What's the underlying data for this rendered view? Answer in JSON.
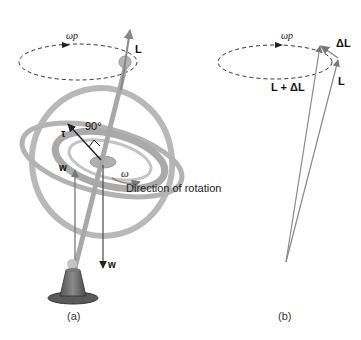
{
  "panel_a": {
    "caption": "(a)",
    "labels": {
      "omega_p": "ωp",
      "L": "L",
      "tau": "τ",
      "angle": "90°",
      "w_upper": "w",
      "w_lower": "w",
      "omega": "ω",
      "direction": "Direction of rotation"
    }
  },
  "panel_b": {
    "caption": "(b)",
    "labels": {
      "omega_p": "ωp",
      "delta_L": "ΔL",
      "L": "L",
      "L_plus_delta_L": "L + ΔL"
    }
  },
  "colors": {
    "ring": "#b3b3b3",
    "ring_dark": "#9a9a9a",
    "vector": "#777777",
    "axis": "#a8a8a8",
    "base": "#6e6e6e",
    "text": "#111111"
  }
}
